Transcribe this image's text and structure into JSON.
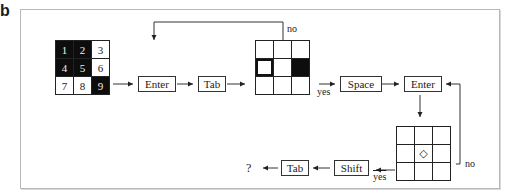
{
  "figure_label": "b",
  "start_grid": {
    "cells": [
      {
        "label": "1",
        "filled": true
      },
      {
        "label": "2",
        "filled": true
      },
      {
        "label": "3",
        "filled": false
      },
      {
        "label": "4",
        "filled": true
      },
      {
        "label": "5",
        "filled": true
      },
      {
        "label": "6",
        "filled": false
      },
      {
        "label": "7",
        "filled": false
      },
      {
        "label": "8",
        "filled": false
      },
      {
        "label": "9",
        "filled": true
      }
    ]
  },
  "keys": {
    "enter_1": "Enter",
    "tab_1": "Tab",
    "space": "Space",
    "enter_2": "Enter",
    "shift": "Shift",
    "tab_2": "Tab"
  },
  "middle_grid": {
    "selected_cell": 4,
    "filled_cell": 6
  },
  "bottom_grid": {
    "marker_cell": 5,
    "marker_symbol": "◇"
  },
  "branch_labels": {
    "top_no": "no",
    "yes_1": "yes",
    "right_no": "no",
    "yes_2": "yes"
  },
  "result": "?"
}
